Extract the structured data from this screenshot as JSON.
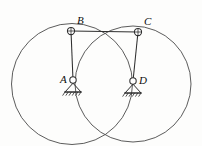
{
  "figure": {
    "kind": "mechanism-diagram",
    "width": 202,
    "height": 146,
    "background_color": "#fdfdfc",
    "stroke_color": "#3b3b3b",
    "label_color": "#0d0d0d",
    "labels": [
      {
        "id": "B",
        "text": "B",
        "x": 77,
        "y": 15
      },
      {
        "id": "C",
        "text": "C",
        "x": 144,
        "y": 16
      },
      {
        "id": "A",
        "text": "A",
        "x": 60,
        "y": 74
      },
      {
        "id": "D",
        "text": "D",
        "x": 139,
        "y": 75
      }
    ],
    "circles": [
      {
        "id": "path-of-B",
        "cx": 72,
        "cy": 84,
        "r": 60.5
      },
      {
        "id": "path-of-C",
        "cx": 133,
        "cy": 84,
        "r": 58
      }
    ],
    "joints": [
      {
        "id": "B",
        "x": 71,
        "y": 31,
        "r": 3.6,
        "type": "pin-joint"
      },
      {
        "id": "C",
        "x": 138,
        "y": 32,
        "r": 3.6,
        "type": "pin-joint"
      },
      {
        "id": "A",
        "x": 73,
        "y": 80,
        "r": 3.2,
        "type": "fixed-pin-support"
      },
      {
        "id": "D",
        "x": 133,
        "y": 81,
        "r": 3.2,
        "type": "fixed-pin-support"
      }
    ],
    "links": [
      {
        "id": "BC",
        "x1": 71,
        "y1": 31,
        "x2": 138,
        "y2": 32
      },
      {
        "id": "AB",
        "x1": 71,
        "y1": 31,
        "x2": 73,
        "y2": 80
      },
      {
        "id": "DC",
        "x1": 138,
        "y1": 32,
        "x2": 133,
        "y2": 81
      }
    ],
    "supports": [
      {
        "id": "A",
        "apex_x": 73,
        "apex_y": 83,
        "base_y": 92,
        "half_width": 8,
        "hatch_count": 6
      },
      {
        "id": "D",
        "apex_x": 133,
        "apex_y": 84,
        "base_y": 93,
        "half_width": 8,
        "hatch_count": 6
      }
    ]
  }
}
